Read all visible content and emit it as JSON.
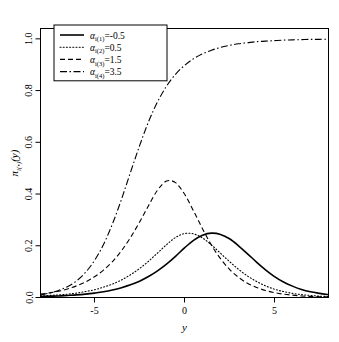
{
  "chart_data": {
    "type": "line",
    "title": "",
    "xlabel": "y",
    "ylabel": "pi_i(.)(y)",
    "xlim": [
      -8,
      8
    ],
    "ylim": [
      0,
      1.04
    ],
    "xticks": [
      -5,
      0,
      5
    ],
    "xticklabels": [
      "-5",
      "0",
      "5"
    ],
    "yticks": [
      0.0,
      0.2,
      0.4,
      0.6,
      0.8,
      1.0
    ],
    "yticklabels": [
      "0.0",
      "0.2",
      "0.4",
      "0.6",
      "0.8",
      "1.0"
    ],
    "grid": false,
    "legend_position": "top-left",
    "x": [
      -8,
      -7.5,
      -7,
      -6.5,
      -6,
      -5.5,
      -5,
      -4.5,
      -4,
      -3.5,
      -3,
      -2.5,
      -2,
      -1.5,
      -1,
      -0.5,
      0,
      0.5,
      1,
      1.5,
      2,
      2.5,
      3,
      3.5,
      4,
      4.5,
      5,
      5.5,
      6,
      6.5,
      7,
      7.5,
      8
    ],
    "series": [
      {
        "name": "alpha_i(1) = -0.5",
        "alpha": -0.5,
        "linestyle": "solid",
        "color": "#000000",
        "peak_x": 0.4,
        "peak_y": 0.25,
        "values": [
          0.004,
          0.005,
          0.006,
          0.008,
          0.01,
          0.013,
          0.017,
          0.022,
          0.029,
          0.038,
          0.049,
          0.063,
          0.081,
          0.103,
          0.129,
          0.159,
          0.192,
          0.221,
          0.241,
          0.249,
          0.244,
          0.227,
          0.2,
          0.169,
          0.137,
          0.107,
          0.081,
          0.06,
          0.044,
          0.031,
          0.022,
          0.016,
          0.011
        ]
      },
      {
        "name": "alpha_i(2) = 0.5",
        "alpha": 0.5,
        "linestyle": "dotted",
        "color": "#000000",
        "peak_x": -0.6,
        "peak_y": 0.247,
        "values": [
          0.006,
          0.008,
          0.01,
          0.013,
          0.017,
          0.023,
          0.03,
          0.04,
          0.052,
          0.068,
          0.088,
          0.112,
          0.14,
          0.172,
          0.204,
          0.232,
          0.247,
          0.246,
          0.23,
          0.203,
          0.171,
          0.139,
          0.109,
          0.083,
          0.062,
          0.045,
          0.032,
          0.023,
          0.016,
          0.011,
          0.008,
          0.005,
          0.004
        ]
      },
      {
        "name": "alpha_i(3) = 1.5",
        "alpha": 1.5,
        "linestyle": "dashed",
        "color": "#000000",
        "peak_x": -2.2,
        "peak_y": 0.45,
        "values": [
          0.013,
          0.018,
          0.024,
          0.033,
          0.045,
          0.06,
          0.08,
          0.106,
          0.139,
          0.181,
          0.232,
          0.291,
          0.355,
          0.415,
          0.45,
          0.444,
          0.4,
          0.335,
          0.266,
          0.202,
          0.15,
          0.109,
          0.078,
          0.055,
          0.039,
          0.027,
          0.019,
          0.013,
          0.009,
          0.006,
          0.004,
          0.003,
          0.002
        ]
      },
      {
        "name": "alpha_i(4) = 3.5",
        "alpha": 3.5,
        "linestyle": "dashdot",
        "color": "#000000",
        "peak_x": 8,
        "peak_y": 1.0,
        "values": [
          0.01,
          0.017,
          0.027,
          0.042,
          0.064,
          0.097,
          0.143,
          0.205,
          0.285,
          0.38,
          0.484,
          0.586,
          0.679,
          0.756,
          0.817,
          0.863,
          0.897,
          0.923,
          0.942,
          0.956,
          0.967,
          0.975,
          0.981,
          0.985,
          0.989,
          0.991,
          0.993,
          0.995,
          0.996,
          0.997,
          0.998,
          0.998,
          0.999
        ]
      }
    ]
  },
  "legend": {
    "items": [
      {
        "symbol": "alpha",
        "sub": "i(1)",
        "eq": "=",
        "value": "-0.5",
        "style": "solid"
      },
      {
        "symbol": "alpha",
        "sub": "i(2)",
        "eq": "=",
        "value": "0.5",
        "style": "dotted"
      },
      {
        "symbol": "alpha",
        "sub": "i(3)",
        "eq": "=",
        "value": "1.5",
        "style": "dashed"
      },
      {
        "symbol": "alpha",
        "sub": "i(4)",
        "eq": "=",
        "value": "3.5",
        "style": "dashdot"
      }
    ]
  },
  "axes": {
    "xlabel": "y",
    "ylabel_parts": {
      "pi": "π",
      "sub": "i(•)",
      "arg": "(y)"
    }
  }
}
